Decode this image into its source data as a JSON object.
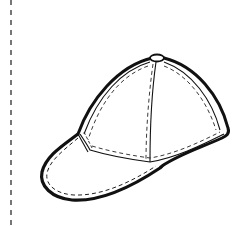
{
  "illustration": {
    "subject": "baseball cap",
    "style": "black line art coloring page",
    "colors": {
      "background": "#ffffff",
      "outline": "#111111",
      "stitching": "#222222",
      "cut_line": "#555555"
    },
    "parts": [
      "crown",
      "button",
      "brim",
      "panel-seams",
      "stitching"
    ]
  },
  "cut_line": {
    "orientation": "vertical",
    "style": "dashed"
  }
}
